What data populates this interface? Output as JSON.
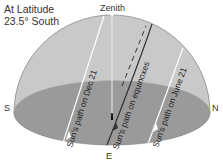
{
  "title": {
    "line1": "At Latitude",
    "line2": "23.5° South"
  },
  "labels": {
    "zenith": "Zenith",
    "south": "S",
    "north": "N",
    "east": "E"
  },
  "paths": {
    "dec21": "Sun's path on Dec 21",
    "equinoxes": "Sun's path on equinoxes",
    "june21": "Sun's path on June 21"
  },
  "colors": {
    "dome": "#c9c9c9",
    "ground": "#9a9a9a",
    "dome_edge": "#8a8a8a",
    "sun_path": "#ffffff",
    "equinox_path": "#333333"
  }
}
